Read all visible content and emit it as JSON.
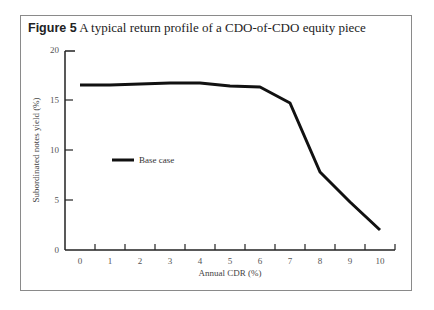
{
  "figure": {
    "label": "Figure 5",
    "caption": "A typical return profile of a CDO-of-CDO equity piece"
  },
  "chart_data": {
    "type": "line",
    "title": "Figure 5 A typical return profile of a CDO-of-CDO equity piece",
    "xlabel": "Annual CDR (%)",
    "ylabel": "Subordinated notes yield (%)",
    "x": [
      0,
      1,
      2,
      3,
      4,
      5,
      6,
      7,
      8,
      9,
      10
    ],
    "series": [
      {
        "name": "Base case",
        "values": [
          16.5,
          16.5,
          16.6,
          16.7,
          16.7,
          16.4,
          16.3,
          14.7,
          7.8,
          4.8,
          2.0
        ]
      }
    ],
    "xticks": [
      "0",
      "1",
      "2",
      "3",
      "4",
      "5",
      "6",
      "7",
      "8",
      "9",
      "10"
    ],
    "yticks": [
      "0",
      "5",
      "10",
      "15",
      "20"
    ],
    "xlim": [
      0,
      10
    ],
    "ylim": [
      0,
      20
    ],
    "grid": false,
    "legend_position": "inside-left-middle",
    "colors": {
      "line": "#111111",
      "axis": "#222222",
      "frame": "#8a8a8a"
    }
  }
}
